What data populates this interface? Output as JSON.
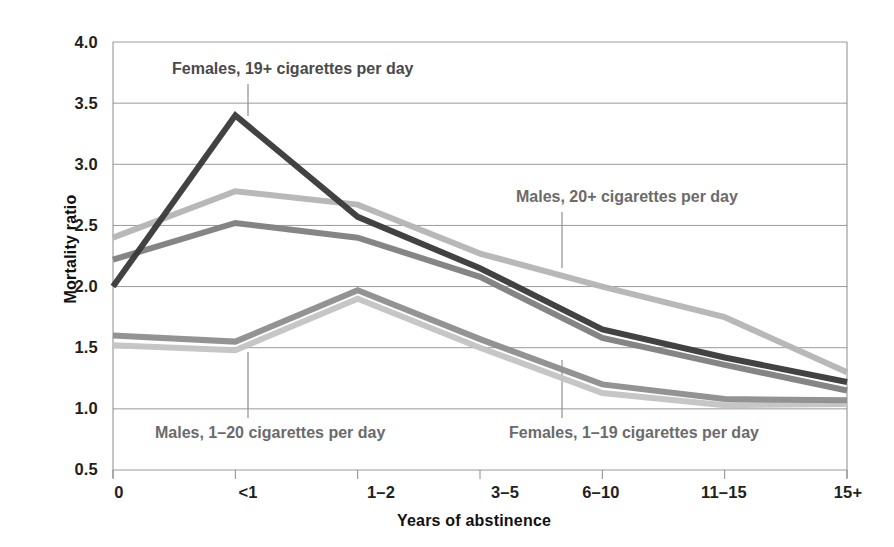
{
  "chart_data": {
    "type": "line",
    "title": "",
    "xlabel": "Years of abstinence",
    "ylabel": "Mortality ratio",
    "categories": [
      "0",
      "<1",
      "1–2",
      "3–5",
      "6–10",
      "11–15",
      "15+"
    ],
    "ylim": [
      0.5,
      4.0
    ],
    "yticks": [
      "0.5",
      "1.0",
      "1.5",
      "2.0",
      "2.5",
      "3.0",
      "3.5",
      "4.0"
    ],
    "ytick_values": [
      0.5,
      1.0,
      1.5,
      2.0,
      2.5,
      3.0,
      3.5,
      4.0
    ],
    "grid": "horizontal",
    "legend": "inline-annotations",
    "series": [
      {
        "name": "Females, 19+ cigarettes per day",
        "color": "#3a3a3a",
        "values": [
          2.0,
          3.4,
          2.57,
          2.15,
          1.65,
          1.42,
          1.22
        ]
      },
      {
        "name": "Males, 20+ cigarettes per day",
        "color": "#b5b5b5",
        "values": [
          2.4,
          2.78,
          2.67,
          2.27,
          2.0,
          1.75,
          1.3
        ]
      },
      {
        "name": "Males, 1–20 cigarettes per day",
        "color": "#808080",
        "values": [
          2.22,
          2.52,
          2.4,
          2.08,
          1.58,
          1.36,
          1.15
        ]
      },
      {
        "name": "Females, 1–19 cigarettes per day",
        "color": "#8f8f8f",
        "values": [
          1.6,
          1.55,
          1.97,
          1.57,
          1.2,
          1.08,
          1.07
        ]
      },
      {
        "name": "Unlabeled lower series",
        "color": "#c4c4c4",
        "values": [
          1.52,
          1.48,
          1.9,
          1.5,
          1.13,
          1.03,
          1.04
        ]
      }
    ],
    "annotations": [
      {
        "text": "Females, 19+ cigarettes per day",
        "label_x": 172,
        "label_y": 60,
        "leader_x": 248,
        "leader_y1": 84,
        "leader_y2": 116
      },
      {
        "text": "Males, 20+ cigarettes per day",
        "label_x": 516,
        "label_y": 188,
        "leader_x": 562,
        "leader_y1": 212,
        "leader_y2": 268
      },
      {
        "text": "Males, 1–20 cigarettes per day",
        "label_x": 155,
        "label_y": 424,
        "leader_x": 248,
        "leader_y1": 352,
        "leader_y2": 418
      },
      {
        "text": "Females, 1–19 cigarettes per day",
        "label_x": 509,
        "label_y": 424,
        "leader_x": 562,
        "leader_y1": 360,
        "leader_y2": 418
      }
    ]
  },
  "axes": {
    "y_title": "Mortality ratio",
    "x_title": "Years of abstinence",
    "y_ticks": [
      {
        "label": "4.0",
        "top": 33
      },
      {
        "label": "3.5",
        "top": 94
      },
      {
        "label": "3.0",
        "top": 155
      },
      {
        "label": "2.5",
        "top": 216
      },
      {
        "label": "2.0",
        "top": 277
      },
      {
        "label": "1.5",
        "top": 338
      },
      {
        "label": "1.0",
        "top": 399
      },
      {
        "label": "0.5",
        "top": 460
      }
    ],
    "x_ticks": [
      {
        "label": "0",
        "left": 79
      },
      {
        "label": "<1",
        "left": 208
      },
      {
        "label": "1–2",
        "left": 341
      },
      {
        "label": "3–5",
        "left": 465
      },
      {
        "label": "6–10",
        "left": 561
      },
      {
        "label": "11–15",
        "left": 684
      },
      {
        "label": "15+",
        "left": 808
      }
    ]
  },
  "colors": {
    "gridline": "#9a9a9a",
    "axis": "#8a8a8a",
    "text": "#231f20",
    "annotation_text": "#6b6b6b",
    "background": "#ffffff"
  }
}
